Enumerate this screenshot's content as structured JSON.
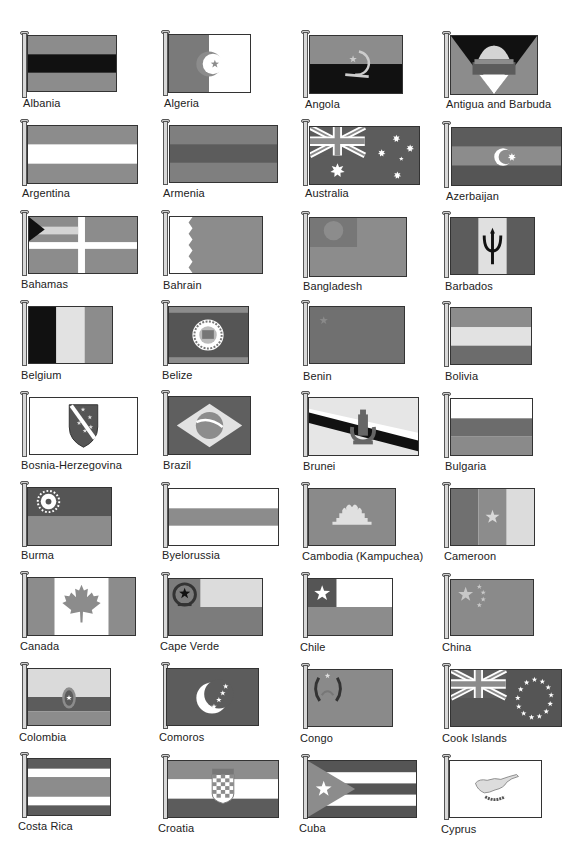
{
  "page": {
    "palette": {
      "red": "#8c8c8c",
      "blue": "#5c5c5c",
      "green": "#7a7a7a",
      "yellow": "#d4d4d4",
      "white": "#ffffff",
      "black": "#111111"
    }
  },
  "flags": [
    {
      "name": "Albania"
    },
    {
      "name": "Algeria"
    },
    {
      "name": "Angola"
    },
    {
      "name": "Antigua and Barbuda"
    },
    {
      "name": "Argentina"
    },
    {
      "name": "Armenia"
    },
    {
      "name": "Australia"
    },
    {
      "name": "Azerbaijan"
    },
    {
      "name": "Bahamas"
    },
    {
      "name": "Bahrain"
    },
    {
      "name": "Bangladesh"
    },
    {
      "name": "Barbados"
    },
    {
      "name": "Belgium"
    },
    {
      "name": "Belize"
    },
    {
      "name": "Benin"
    },
    {
      "name": "Bolivia"
    },
    {
      "name": "Bosnia-Herzegovina"
    },
    {
      "name": "Brazil"
    },
    {
      "name": "Brunei"
    },
    {
      "name": "Bulgaria"
    },
    {
      "name": "Burma"
    },
    {
      "name": "Byelorussia"
    },
    {
      "name": "Cambodia (Kampuchea)"
    },
    {
      "name": "Cameroon"
    },
    {
      "name": "Canada"
    },
    {
      "name": "Cape Verde"
    },
    {
      "name": "Chile"
    },
    {
      "name": "China"
    },
    {
      "name": "Colombia"
    },
    {
      "name": "Comoros"
    },
    {
      "name": "Congo"
    },
    {
      "name": "Cook Islands"
    },
    {
      "name": "Costa Rica"
    },
    {
      "name": "Croatia"
    },
    {
      "name": "Cuba"
    },
    {
      "name": "Cyprus"
    }
  ]
}
